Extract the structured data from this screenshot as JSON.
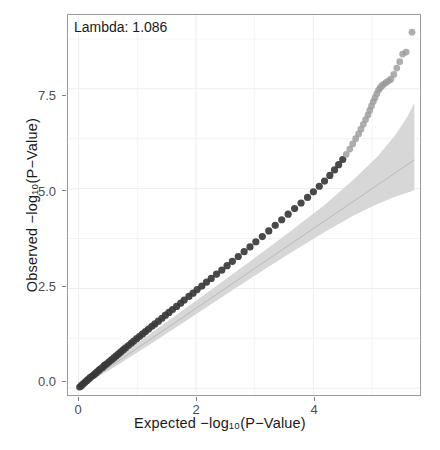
{
  "chart_data": {
    "type": "scatter",
    "title": "",
    "subtitle": "",
    "xlabel": "Expected  −log₁₀(P−Value)",
    "ylabel": "Observed  −log₁₀(P−Value)",
    "annotation": "Lambda:  1.086",
    "lambda_value": 1.086,
    "xlim": [
      -0.18,
      5.85
    ],
    "ylim": [
      -0.22,
      9.35
    ],
    "xticks": [
      0,
      2,
      4
    ],
    "xtick_labels": [
      "0",
      "2",
      "4"
    ],
    "yticks": [
      0.0,
      2.5,
      5.0,
      7.5
    ],
    "ytick_labels": [
      "0.0",
      "2.5",
      "5.0",
      "7.5"
    ],
    "grid": true,
    "grid_minor": true,
    "legend": "none",
    "point_color_dense": "#3a3a3a",
    "point_color_tail": "#9a9a9a",
    "reference_line_color": "#b9b9b9",
    "confidence_band_color": "#d7d7d7",
    "panel_border_color": "#9a9a9a",
    "background": "#ffffff",
    "series": [
      {
        "name": "observed-vs-expected",
        "points": [
          [
            0.02,
            0.03
          ],
          [
            0.05,
            0.07
          ],
          [
            0.08,
            0.11
          ],
          [
            0.11,
            0.15
          ],
          [
            0.14,
            0.19
          ],
          [
            0.17,
            0.23
          ],
          [
            0.2,
            0.27
          ],
          [
            0.24,
            0.31
          ],
          [
            0.27,
            0.35
          ],
          [
            0.3,
            0.39
          ],
          [
            0.34,
            0.44
          ],
          [
            0.37,
            0.48
          ],
          [
            0.41,
            0.52
          ],
          [
            0.44,
            0.57
          ],
          [
            0.48,
            0.61
          ],
          [
            0.52,
            0.66
          ],
          [
            0.56,
            0.71
          ],
          [
            0.6,
            0.76
          ],
          [
            0.64,
            0.81
          ],
          [
            0.68,
            0.86
          ],
          [
            0.72,
            0.91
          ],
          [
            0.76,
            0.96
          ],
          [
            0.8,
            1.01
          ],
          [
            0.85,
            1.07
          ],
          [
            0.9,
            1.13
          ],
          [
            0.94,
            1.18
          ],
          [
            0.99,
            1.24
          ],
          [
            1.04,
            1.3
          ],
          [
            1.09,
            1.36
          ],
          [
            1.14,
            1.42
          ],
          [
            1.19,
            1.48
          ],
          [
            1.25,
            1.55
          ],
          [
            1.3,
            1.61
          ],
          [
            1.36,
            1.68
          ],
          [
            1.42,
            1.75
          ],
          [
            1.48,
            1.83
          ],
          [
            1.54,
            1.9
          ],
          [
            1.6,
            1.97
          ],
          [
            1.67,
            2.05
          ],
          [
            1.74,
            2.13
          ],
          [
            1.8,
            2.21
          ],
          [
            1.88,
            2.3
          ],
          [
            1.95,
            2.38
          ],
          [
            2.02,
            2.47
          ],
          [
            2.1,
            2.56
          ],
          [
            2.18,
            2.66
          ],
          [
            2.26,
            2.75
          ],
          [
            2.35,
            2.86
          ],
          [
            2.44,
            2.96
          ],
          [
            2.53,
            3.07
          ],
          [
            2.62,
            3.18
          ],
          [
            2.72,
            3.3
          ],
          [
            2.82,
            3.42
          ],
          [
            2.92,
            3.54
          ],
          [
            3.02,
            3.67
          ],
          [
            3.13,
            3.8
          ],
          [
            3.24,
            3.94
          ],
          [
            3.35,
            4.08
          ],
          [
            3.46,
            4.22
          ],
          [
            3.57,
            4.36
          ],
          [
            3.68,
            4.5
          ],
          [
            3.79,
            4.64
          ],
          [
            3.9,
            4.78
          ],
          [
            4.0,
            4.92
          ],
          [
            4.1,
            5.06
          ],
          [
            4.19,
            5.19
          ],
          [
            4.28,
            5.33
          ],
          [
            4.36,
            5.47
          ],
          [
            4.43,
            5.6
          ],
          [
            4.5,
            5.73
          ],
          [
            4.56,
            5.86
          ],
          [
            4.62,
            5.99
          ],
          [
            4.67,
            6.12
          ],
          [
            4.72,
            6.25
          ],
          [
            4.77,
            6.37
          ],
          [
            4.81,
            6.49
          ],
          [
            4.85,
            6.61
          ],
          [
            4.89,
            6.73
          ],
          [
            4.93,
            6.85
          ],
          [
            4.96,
            6.96
          ],
          [
            4.99,
            7.07
          ],
          [
            5.02,
            7.18
          ],
          [
            5.05,
            7.28
          ],
          [
            5.08,
            7.38
          ],
          [
            5.11,
            7.47
          ],
          [
            5.14,
            7.53
          ],
          [
            5.17,
            7.58
          ],
          [
            5.2,
            7.62
          ],
          [
            5.24,
            7.66
          ],
          [
            5.28,
            7.7
          ],
          [
            5.32,
            7.74
          ],
          [
            5.37,
            7.86
          ],
          [
            5.42,
            8.02
          ],
          [
            5.47,
            8.18
          ],
          [
            5.52,
            8.37
          ],
          [
            5.58,
            8.42
          ],
          [
            5.68,
            8.92
          ]
        ],
        "n_points": 97
      }
    ],
    "reference_line": {
      "name": "y = x",
      "from": [
        0,
        0
      ],
      "to": [
        5.72,
        5.72
      ]
    },
    "confidence_band": {
      "name": "95% confidence envelope",
      "x": [
        0.0,
        0.6,
        1.2,
        1.8,
        2.4,
        3.0,
        3.6,
        4.2,
        4.7,
        5.1,
        5.4,
        5.6,
        5.72
      ],
      "lower": [
        0.0,
        0.52,
        1.08,
        1.66,
        2.24,
        2.82,
        3.38,
        3.92,
        4.34,
        4.62,
        4.8,
        4.9,
        4.96
      ],
      "upper": [
        0.0,
        0.7,
        1.34,
        1.98,
        2.62,
        3.26,
        3.92,
        4.6,
        5.25,
        5.82,
        6.35,
        6.8,
        7.15
      ]
    }
  }
}
